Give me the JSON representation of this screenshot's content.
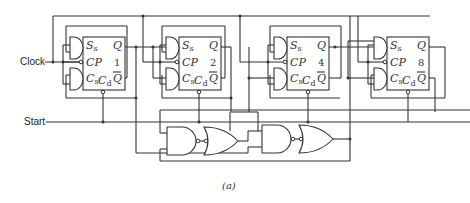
{
  "diagram": {
    "inputs": {
      "clock": "Clock",
      "start": "Start"
    },
    "flip_flops": [
      {
        "index": "1",
        "pins": {
          "set": "S",
          "set_sub": "s",
          "clock": "CP",
          "clear": "C",
          "clear_sub": "s",
          "direct_clear": "C",
          "direct_clear_sub": "d",
          "q": "Q",
          "q_bar": "Q"
        }
      },
      {
        "index": "2",
        "pins": {
          "set": "S",
          "set_sub": "s",
          "clock": "CP",
          "clear": "C",
          "clear_sub": "s",
          "direct_clear": "C",
          "direct_clear_sub": "d",
          "q": "Q",
          "q_bar": "Q"
        }
      },
      {
        "index": "4",
        "pins": {
          "set": "S",
          "set_sub": "s",
          "clock": "CP",
          "clear": "C",
          "clear_sub": "s",
          "direct_clear": "C",
          "direct_clear_sub": "d",
          "q": "Q",
          "q_bar": "Q"
        }
      },
      {
        "index": "8",
        "pins": {
          "set": "S",
          "set_sub": "s",
          "clock": "CP",
          "clear": "C",
          "clear_sub": "s",
          "direct_clear": "C",
          "direct_clear_sub": "d",
          "q": "Q",
          "q_bar": "Q"
        }
      }
    ],
    "logic_gates": [
      "NAND",
      "OR (inverted input)",
      "NAND",
      "OR (inverted input)"
    ],
    "caption": "(a)"
  }
}
